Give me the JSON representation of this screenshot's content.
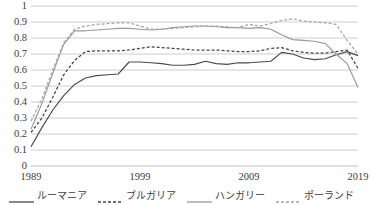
{
  "chart_data": {
    "type": "line",
    "title": "",
    "subtitle": "",
    "xlabel": "",
    "ylabel": "",
    "xlim": [
      1989,
      2019
    ],
    "ylim": [
      0,
      1
    ],
    "y_tick_labels": [
      "1",
      "0.9",
      "0.8",
      "0.7",
      "0.6",
      "0.5",
      "0.4",
      "0.3",
      "0.2",
      "0.1",
      "0"
    ],
    "y_tick_values": [
      1,
      0.9,
      0.8,
      0.7,
      0.6,
      0.5,
      0.4,
      0.3,
      0.2,
      0.1,
      0
    ],
    "x_tick_labels": [
      "1989",
      "1999",
      "2009",
      "2019"
    ],
    "x_tick_values": [
      1989,
      1999,
      2009,
      2019
    ],
    "grid": "horizontal",
    "legend_position": "bottom",
    "x": [
      1989,
      1990,
      1991,
      1992,
      1993,
      1994,
      1995,
      1996,
      1997,
      1998,
      1999,
      2000,
      2001,
      2002,
      2003,
      2004,
      2005,
      2006,
      2007,
      2008,
      2009,
      2010,
      2011,
      2012,
      2013,
      2014,
      2015,
      2016,
      2017,
      2018,
      2019
    ],
    "series": [
      {
        "name": "ルーマニア",
        "style": "solid",
        "color": "#4a4a4a",
        "values": [
          0.12,
          0.24,
          0.35,
          0.44,
          0.51,
          0.55,
          0.565,
          0.57,
          0.575,
          0.65,
          0.65,
          0.645,
          0.64,
          0.63,
          0.63,
          0.635,
          0.655,
          0.64,
          0.635,
          0.645,
          0.645,
          0.65,
          0.655,
          0.71,
          0.7,
          0.675,
          0.665,
          0.67,
          0.695,
          0.715,
          0.69
        ]
      },
      {
        "name": "ブルガリア",
        "style": "dashed",
        "color": "#434343",
        "values": [
          0.21,
          0.3,
          0.43,
          0.57,
          0.66,
          0.715,
          0.72,
          0.72,
          0.72,
          0.725,
          0.735,
          0.745,
          0.74,
          0.735,
          0.73,
          0.725,
          0.725,
          0.725,
          0.72,
          0.715,
          0.715,
          0.72,
          0.735,
          0.74,
          0.72,
          0.71,
          0.705,
          0.705,
          0.715,
          0.725,
          0.61
        ]
      },
      {
        "name": "ハンガリー",
        "style": "solid",
        "color": "#9a9a9a",
        "values": [
          0.23,
          0.39,
          0.58,
          0.76,
          0.845,
          0.845,
          0.85,
          0.855,
          0.86,
          0.86,
          0.855,
          0.85,
          0.855,
          0.865,
          0.87,
          0.875,
          0.875,
          0.87,
          0.865,
          0.865,
          0.86,
          0.865,
          0.855,
          0.82,
          0.79,
          0.785,
          0.78,
          0.765,
          0.7,
          0.64,
          0.49
        ]
      },
      {
        "name": "ポーランド",
        "style": "dashed",
        "color": "#a5a5a5",
        "values": [
          0.28,
          0.42,
          0.6,
          0.77,
          0.855,
          0.875,
          0.885,
          0.89,
          0.895,
          0.895,
          0.875,
          0.855,
          0.855,
          0.86,
          0.865,
          0.87,
          0.875,
          0.875,
          0.87,
          0.865,
          0.885,
          0.875,
          0.89,
          0.91,
          0.92,
          0.905,
          0.9,
          0.895,
          0.885,
          0.785,
          0.7
        ]
      }
    ]
  },
  "axis": {
    "y_labels": [
      "1",
      "0.9",
      "0.8",
      "0.7",
      "0.6",
      "0.5",
      "0.4",
      "0.3",
      "0.2",
      "0.1",
      "0"
    ],
    "x_labels": [
      "1989",
      "1999",
      "2009",
      "2019"
    ]
  },
  "legend": {
    "items": [
      {
        "label": "ルーマニア",
        "style": "solid",
        "color": "#4a4a4a"
      },
      {
        "label": "ブルガリア",
        "style": "dashed",
        "color": "#434343"
      },
      {
        "label": "ハンガリー",
        "style": "solid",
        "color": "#9a9a9a"
      },
      {
        "label": "ポーランド",
        "style": "dashed",
        "color": "#a5a5a5"
      }
    ]
  },
  "colors": {
    "grid": "#b7b7b7",
    "text": "#3d3d3d",
    "background": "#ffffff"
  }
}
